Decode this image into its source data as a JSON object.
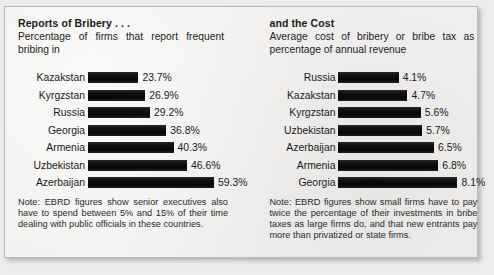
{
  "chart_data": [
    {
      "type": "bar",
      "orientation": "horizontal",
      "title": "Reports of Bribery . . .",
      "subtitle": "Percentage of firms that report frequent bribing in",
      "xlabel": "",
      "ylabel": "",
      "categories": [
        "Kazakstan",
        "Kyrgzstan",
        "Russia",
        "Georgia",
        "Armenia",
        "Uzbekistan",
        "Azerbaijan"
      ],
      "values": [
        23.7,
        26.9,
        29.2,
        36.8,
        40.3,
        46.6,
        59.3
      ],
      "value_labels": [
        "23.7%",
        "26.9%",
        "29.2%",
        "36.8%",
        "40.3%",
        "46.6%",
        "59.3%"
      ],
      "units": "percent",
      "xlim": [
        0,
        59.3
      ],
      "grid": false,
      "legend": "none",
      "bar_color": "#0b0b0b",
      "note": "Note: EBRD figures show senior executives also have to spend between 5% and 15% of their time dealing with public officials in these countries."
    },
    {
      "type": "bar",
      "orientation": "horizontal",
      "title": "and the Cost",
      "subtitle": "Average cost of bribery or bribe tax as percentage of annual revenue",
      "xlabel": "",
      "ylabel": "",
      "categories": [
        "Russia",
        "Kazakstan",
        "Kyrgzstan",
        "Uzbekistan",
        "Azerbaijan",
        "Armenia",
        "Georgia"
      ],
      "values": [
        4.1,
        4.7,
        5.6,
        5.7,
        6.5,
        6.8,
        8.1
      ],
      "value_labels": [
        "4.1%",
        "4.7%",
        "5.6%",
        "5.7%",
        "6.5%",
        "6.8%",
        "8.1%"
      ],
      "units": "percent",
      "xlim": [
        0,
        8.1
      ],
      "grid": false,
      "legend": "none",
      "bar_color": "#0b0b0b",
      "note": "Note: EBRD figures show small firms have to pay twice the percentage of their investments in bribe taxes as large firms do, and that new entrants pay more than privatized or state firms."
    }
  ],
  "layout": {
    "background_color": "#ececea",
    "panel_color": "#f2f1ef",
    "panel_border_color": "#b9b9b7",
    "text_color": "#1a1a1a"
  }
}
